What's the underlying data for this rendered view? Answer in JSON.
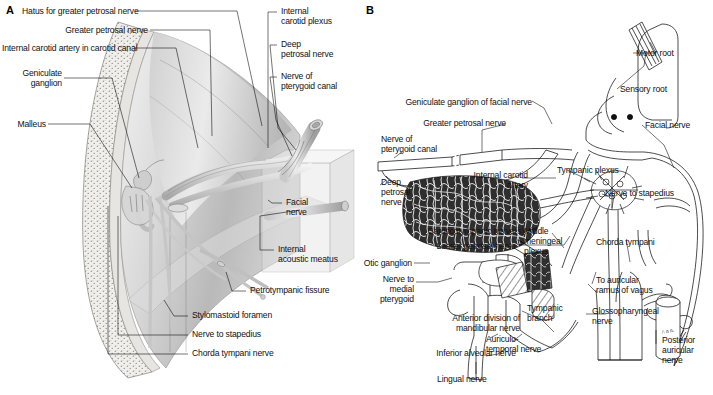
{
  "figure": {
    "background_color": "#ffffff",
    "line_color": "#1a1a1a"
  },
  "panel_a": {
    "letter": "A",
    "description": "Shaded three-dimensional cutaway of the petrous temporal bone showing the course of the facial nerve",
    "labels": [
      {
        "id": "hiatus-greater-petrosal",
        "text": "Hatus for greater petrosal nerve",
        "align": "left",
        "x": 16,
        "y": 7
      },
      {
        "id": "greater-petrosal-nerve",
        "text": "Greater petrosal nerve",
        "align": "right",
        "x": 54,
        "y": 26
      },
      {
        "id": "internal-carotid-artery-canal",
        "text": "Internal carotid artery in carotid canal",
        "align": "left",
        "x": 2,
        "y": 44
      },
      {
        "id": "geniculate-ganglion",
        "text": "Geniculate\nganglion",
        "align": "right",
        "x": 2,
        "y": 69
      },
      {
        "id": "malleus",
        "text": "Malleus",
        "align": "right",
        "x": 10,
        "y": 120
      },
      {
        "id": "internal-carotid-plexus",
        "text": "Internal\ncarotid plexus",
        "align": "left",
        "x": 281,
        "y": 7
      },
      {
        "id": "deep-petrosal-nerve",
        "text": "Deep\npetrosal nerve",
        "align": "left",
        "x": 281,
        "y": 40
      },
      {
        "id": "nerve-of-pterygoid-canal",
        "text": "Nerve of\npterygoid canal",
        "align": "left",
        "x": 281,
        "y": 72
      },
      {
        "id": "facial-nerve",
        "text": "Facial\nnerve",
        "align": "left",
        "x": 285,
        "y": 198
      },
      {
        "id": "internal-acoustic-meatus",
        "text": "Internal\nacoustic meatus",
        "align": "left",
        "x": 277,
        "y": 245
      },
      {
        "id": "petrotympanic-fissure",
        "text": "Petrotympanic fissure",
        "align": "left",
        "x": 249,
        "y": 288
      },
      {
        "id": "stylomastoid-foramen",
        "text": "Stylomastoid foramen",
        "align": "left",
        "x": 192,
        "y": 313
      },
      {
        "id": "nerve-to-stapedius",
        "text": "Nerve to stapedius",
        "align": "left",
        "x": 192,
        "y": 332
      },
      {
        "id": "chorda-tympani-nerve",
        "text": "Chorda tympani nerve",
        "align": "left",
        "x": 192,
        "y": 351
      }
    ]
  },
  "panel_b": {
    "letter": "B",
    "description": "Line-drawing schematic of the facial nerve, its branches and communicating plexuses",
    "labels": [
      {
        "id": "motor-root",
        "text": "Motor root",
        "align": "left",
        "x": 636,
        "y": 50
      },
      {
        "id": "sensory-root",
        "text": "Sensory root",
        "align": "left",
        "x": 620,
        "y": 86
      },
      {
        "id": "facial-nerve-b",
        "text": "Facial nerve",
        "align": "left",
        "x": 645,
        "y": 122
      },
      {
        "id": "geniculate-ganglion-facial",
        "text": "Geniculate ganglion of facial nerve",
        "align": "right",
        "x": 404,
        "y": 99
      },
      {
        "id": "greater-petrosal-nerve-b",
        "text": "Greater petrosal nerve",
        "align": "right",
        "x": 420,
        "y": 120
      },
      {
        "id": "nerve-of-pterygoid-canal-b",
        "text": "Nerve of\npterygoid canal",
        "align": "left",
        "x": 382,
        "y": 136
      },
      {
        "id": "internal-carotid-artery-b",
        "text": "Internal carotid\nartery",
        "align": "right",
        "x": 473,
        "y": 172
      },
      {
        "id": "tympanic-plexus",
        "text": "Tympanic plexus",
        "align": "left",
        "x": 557,
        "y": 167
      },
      {
        "id": "deep-petrosal-nerve-b",
        "text": "Deep\npetrosal\nnerve",
        "align": "left",
        "x": 381,
        "y": 179
      },
      {
        "id": "nerve-to-stapedius-b",
        "text": "Nerve to stapedius",
        "align": "left",
        "x": 605,
        "y": 190
      },
      {
        "id": "caroticotympanic-nerves",
        "text": "Caroticotympanic nerve(s)",
        "align": "right",
        "x": 368,
        "y": 228
      },
      {
        "id": "lesser-petrosal-nerve",
        "text": "Lesser petrosal nerve",
        "align": "right",
        "x": 382,
        "y": 243
      },
      {
        "id": "middle-meningeal-plexus",
        "text": "Middle\nmeningeal\nplexus",
        "align": "left",
        "x": 524,
        "y": 228
      },
      {
        "id": "chorda-tympani-b",
        "text": "Chorda tympani",
        "align": "left",
        "x": 596,
        "y": 239
      },
      {
        "id": "otic-ganglion",
        "text": "Otic ganglion",
        "align": "right",
        "x": 403,
        "y": 261
      },
      {
        "id": "nerve-to-medial-pterygoid",
        "text": "Nerve to medial\npterygoid",
        "align": "right",
        "x": 370,
        "y": 277
      },
      {
        "id": "to-auricular-ramus-vagus",
        "text": "To auricular\nramus of vagus",
        "align": "left",
        "x": 596,
        "y": 277
      },
      {
        "id": "tympanic-branch",
        "text": "Tympanic\nbranch",
        "align": "left",
        "x": 527,
        "y": 305
      },
      {
        "id": "glossopharyngeal-nerve",
        "text": "Glossopharyngeal\nnerve",
        "align": "left",
        "x": 592,
        "y": 308
      },
      {
        "id": "anterior-division-mandibular",
        "text": "Anterior division of\nmandibular nerve",
        "align": "right",
        "x": 366,
        "y": 315
      },
      {
        "id": "posterior-auricular-nerve",
        "text": "Posterior\nauricular\nnerve",
        "align": "left",
        "x": 662,
        "y": 337
      },
      {
        "id": "auriculotemporal-nerve",
        "text": "Auriculo-\ntemporal nerve",
        "align": "left",
        "x": 486,
        "y": 336
      },
      {
        "id": "inferior-alveolar-nerve",
        "text": "Inferior alveolar nerve",
        "align": "right",
        "x": 362,
        "y": 350
      },
      {
        "id": "lingual-nerve",
        "text": "Lingual nerve",
        "align": "left",
        "x": 437,
        "y": 376
      }
    ]
  }
}
